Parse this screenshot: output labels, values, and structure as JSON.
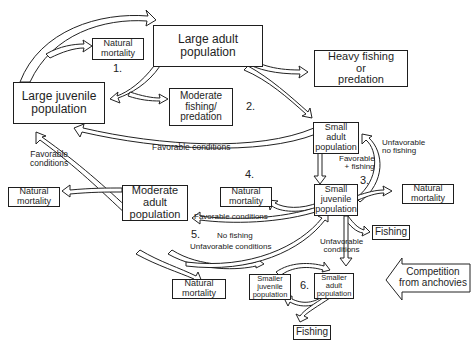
{
  "diagram": {
    "nodes": {
      "large_adult": {
        "line1": "Large adult",
        "line2": "population"
      },
      "natural_mortality_1": {
        "line1": "Natural",
        "line2": "mortality"
      },
      "large_juvenile": {
        "line1": "Large juvenile",
        "line2": "population"
      },
      "moderate_fishing": {
        "line1": "Moderate",
        "line2": "fishing/",
        "line3": "predation"
      },
      "heavy_fishing": {
        "line1": "Heavy fishing",
        "line2": "or",
        "line3": "predation"
      },
      "small_adult": {
        "line1": "Small",
        "line2": "adult",
        "line3": "population"
      },
      "small_juvenile": {
        "line1": "Small",
        "line2": "juvenile",
        "line3": "population"
      },
      "natural_mortality_left": {
        "line1": "Natural",
        "line2": "mortality"
      },
      "moderate_adult": {
        "line1": "Moderate",
        "line2": "adult",
        "line3": "population"
      },
      "natural_mortality_4": {
        "line1": "Natural",
        "line2": "mortality"
      },
      "natural_mortality_right": {
        "line1": "Natural",
        "line2": "mortality"
      },
      "fishing_right": {
        "line1": "Fishing"
      },
      "natural_mortality_bottom": {
        "line1": "Natural",
        "line2": "mortality"
      },
      "smaller_juvenile": {
        "line1": "Smaller",
        "line2": "juvenile",
        "line3": "population"
      },
      "smaller_adult": {
        "line1": "Smaller",
        "line2": "adult",
        "line3": "population"
      },
      "fishing_bottom": {
        "line1": "Fishing"
      },
      "competition": {
        "line1": "Competition",
        "line2": "from anchovies"
      }
    },
    "labels": {
      "favorable_conditions_top": "Favorable conditions",
      "favorable_conditions_left_1": "Favorable",
      "favorable_conditions_left_2": "conditions",
      "unfavorable_no_fishing_1": "Unfavorable",
      "unfavorable_no_fishing_2": "no fishing",
      "favorable_fishing_1": "Favorable",
      "favorable_fishing_2": "+ fishing",
      "favorable_conditions_mid": "Favorable conditions",
      "no_fishing": "No fishing",
      "unfavorable_conditions_mid": "Unfavorable conditions",
      "unfavorable_conditions_right_1": "Unfavorable",
      "unfavorable_conditions_right_2": "conditions"
    },
    "numbers": [
      "1.",
      "2.",
      "3.",
      "4.",
      "5.",
      "6."
    ],
    "colors": {
      "stroke": "#1e1e1e",
      "fill": "#ffffff"
    }
  }
}
